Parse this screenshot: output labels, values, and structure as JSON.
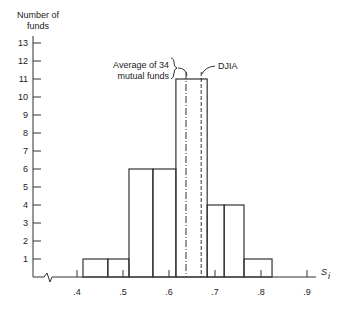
{
  "chart_data": {
    "type": "bar",
    "title": "",
    "xlabel": "S_i",
    "ylabel": "Number of funds",
    "ylabel_lines": [
      "Number of",
      "funds"
    ],
    "x_ticks": [
      ".4",
      ".5",
      ".6",
      ".7",
      ".8",
      ".9"
    ],
    "y_ticks": [
      "1",
      "2",
      "3",
      "4",
      "5",
      "6",
      "7",
      "8",
      "9",
      "10",
      "11",
      "12",
      "13"
    ],
    "xlim": [
      0.35,
      0.92
    ],
    "ylim": [
      0,
      13
    ],
    "grid": false,
    "bars": [
      {
        "x0": 0.413,
        "x1": 0.467,
        "value": 1
      },
      {
        "x0": 0.467,
        "x1": 0.513,
        "value": 1
      },
      {
        "x0": 0.513,
        "x1": 0.565,
        "value": 6
      },
      {
        "x0": 0.565,
        "x1": 0.615,
        "value": 6
      },
      {
        "x0": 0.615,
        "x1": 0.683,
        "value": 11
      },
      {
        "x0": 0.683,
        "x1": 0.72,
        "value": 4
      },
      {
        "x0": 0.72,
        "x1": 0.763,
        "value": 4
      },
      {
        "x0": 0.763,
        "x1": 0.824,
        "value": 1
      }
    ],
    "reference_lines": [
      {
        "label": "Average of 34 mutual funds",
        "x": 0.637,
        "style": "dash-dot"
      },
      {
        "label": "DJIA",
        "x": 0.67,
        "style": "dashed"
      }
    ],
    "annotations": {
      "avg_line1": "Average of 34",
      "avg_line2": "mutual funds",
      "djia": "DJIA"
    }
  }
}
